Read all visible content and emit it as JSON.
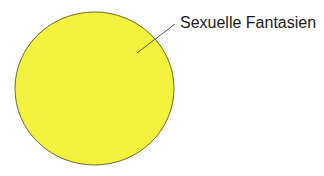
{
  "diagram": {
    "type": "venn",
    "sets": [
      {
        "label": "Sexuelle Fantasien",
        "fill": "#f2f23c",
        "stroke": "#6b6a2a"
      }
    ],
    "leader_line_color": "#555555"
  }
}
